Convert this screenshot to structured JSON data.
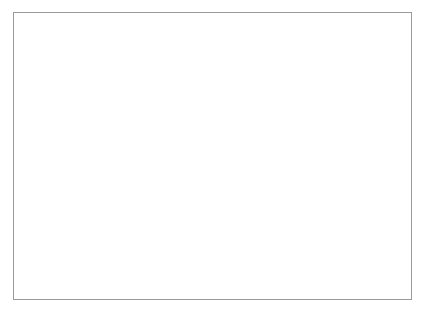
{
  "chart_data": {
    "type": "line",
    "title": "",
    "subtitle": "",
    "xlabel": "",
    "ylabel": "Trillion USD",
    "ylabel_lines": [
      "Trillion",
      "USD"
    ],
    "grid": false,
    "legend": false,
    "legend_position": "none",
    "line_color": "#595959",
    "axis_color": "#6e6e6e",
    "border_color": "#9a9a9a",
    "xlim": [
      1990,
      2007
    ],
    "ylim": [
      0,
      1.9
    ],
    "xticks": [
      1990,
      1992,
      1994,
      1996,
      1998,
      2000,
      2002,
      2004,
      2006
    ],
    "xtick_labels": [
      "1990",
      "1992",
      "1994",
      "1996",
      "1998",
      "2000",
      "2002",
      "2004",
      "2006"
    ],
    "yticks": [
      0,
      0.2,
      0.4,
      0.6,
      0.8,
      1.0,
      1.2,
      1.4,
      1.6
    ],
    "ytick_labels": [
      "0",
      "0.2",
      "0.4",
      "0.6",
      "0.8",
      "1.0",
      "1.2",
      "1.4",
      "1.6"
    ],
    "x": [
      1990,
      1991,
      1992,
      1993,
      1994,
      1995,
      1996,
      1997,
      1998,
      1999,
      2000,
      2001,
      2002,
      2003,
      2004,
      2005,
      2006,
      2007
    ],
    "values": [
      0.02,
      0.05,
      0.06,
      0.055,
      0.045,
      0.06,
      0.08,
      0.09,
      0.09,
      0.14,
      0.17,
      0.21,
      0.26,
      0.45,
      0.72,
      0.93,
      1.35,
      1.9
    ],
    "series": [
      {
        "name": "",
        "values": [
          0.02,
          0.05,
          0.06,
          0.055,
          0.045,
          0.06,
          0.08,
          0.09,
          0.09,
          0.14,
          0.17,
          0.21,
          0.26,
          0.45,
          0.72,
          0.93,
          1.35,
          1.9
        ]
      }
    ],
    "annotations": []
  }
}
